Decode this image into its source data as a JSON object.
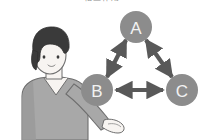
{
  "figure": {
    "title_clipped": "相互作用",
    "title_visible": false,
    "background_color": "#ffffff"
  },
  "person": {
    "name": "presenter-illustration",
    "description": "person with short dark hair gesturing toward diagram",
    "hair_color": "#3a3a3a",
    "skin_color": "#f7f4f1",
    "shirt_color": "#a8a8a8",
    "shirt_shadow_color": "#949494",
    "outline_color": "#6e6e6e"
  },
  "diagram": {
    "type": "triangle-relationship",
    "node_fill": "#8c8c8c",
    "node_label_color": "#f2f2f2",
    "arrow_color": "#595959",
    "nodes": [
      {
        "id": "A",
        "label": "A",
        "cx": 136,
        "cy": 27,
        "r": 16
      },
      {
        "id": "B",
        "label": "B",
        "cx": 97,
        "cy": 90,
        "r": 16
      },
      {
        "id": "C",
        "label": "C",
        "cx": 182,
        "cy": 90,
        "r": 16
      }
    ],
    "edges": [
      {
        "from": "B",
        "to": "A",
        "bidirectional": true
      },
      {
        "from": "A",
        "to": "C",
        "bidirectional": true
      },
      {
        "from": "B",
        "to": "C",
        "bidirectional": true
      }
    ]
  }
}
